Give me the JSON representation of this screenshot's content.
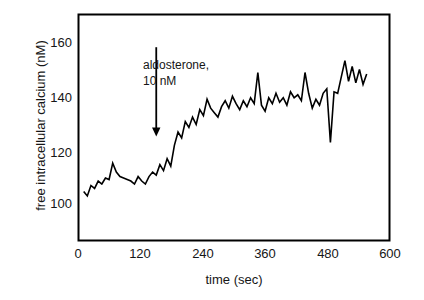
{
  "chart_data": {
    "type": "line",
    "title": "",
    "xlabel": "time (sec)",
    "ylabel": "free intracellular calcium (nM)",
    "xlim": [
      0,
      600
    ],
    "ylim": [
      92,
      168
    ],
    "xticks": [
      0,
      120,
      240,
      360,
      480,
      600
    ],
    "xtick_labels": [
      "0",
      "120",
      "240",
      "360",
      "480",
      "600"
    ],
    "yticks": [
      100,
      120,
      140,
      160
    ],
    "ytick_labels": [
      "100",
      "120",
      "140",
      "160"
    ],
    "grid": false,
    "legend": null,
    "line_color": "#000000",
    "line_width": 1.6,
    "annotations": [
      {
        "name": "aldosterone-annotation",
        "line1": "aldosterone,",
        "line2": "10 nM",
        "arrow": {
          "x": 150,
          "y_from": 157,
          "y_to": 127
        }
      }
    ],
    "series": [
      {
        "name": "free intracellular calcium",
        "x": [
          10,
          17,
          24,
          31,
          38,
          45,
          52,
          59,
          66,
          73,
          80,
          87,
          94,
          101,
          108,
          115,
          122,
          129,
          136,
          143,
          150,
          157,
          164,
          171,
          178,
          185,
          192,
          199,
          206,
          213,
          220,
          227,
          234,
          241,
          248,
          255,
          262,
          269,
          276,
          283,
          290,
          297,
          304,
          311,
          318,
          325,
          332,
          339,
          346,
          353,
          360,
          367,
          374,
          381,
          388,
          395,
          402,
          409,
          416,
          423,
          430,
          437,
          444,
          451,
          458,
          465,
          472,
          479,
          486,
          493,
          500,
          507,
          514,
          521,
          528,
          535,
          542,
          549,
          556
        ],
        "y": [
          108.5,
          107.0,
          110.5,
          109.5,
          112.0,
          111.0,
          113.0,
          112.5,
          118.0,
          115.0,
          113.5,
          113.0,
          112.5,
          112.0,
          111.0,
          113.5,
          112.0,
          111.0,
          113.5,
          115.0,
          114.0,
          117.5,
          115.5,
          119.5,
          117.0,
          124.0,
          128.5,
          126.5,
          132.0,
          130.0,
          133.5,
          131.0,
          136.0,
          134.0,
          139.5,
          136.5,
          135.0,
          133.5,
          137.0,
          139.0,
          136.5,
          140.5,
          138.0,
          136.0,
          139.0,
          137.0,
          140.0,
          138.0,
          148.5,
          137.5,
          135.5,
          140.0,
          138.0,
          141.5,
          138.5,
          140.0,
          137.5,
          142.0,
          140.0,
          141.0,
          139.0,
          148.5,
          141.5,
          136.5,
          139.5,
          137.5,
          141.5,
          143.0,
          125.0,
          142.0,
          141.5,
          147.0,
          152.5,
          145.5,
          150.5,
          145.0,
          149.5,
          144.5,
          148.0
        ]
      }
    ]
  },
  "axes": {
    "frame_color": "#000000",
    "frame_width": 2
  }
}
